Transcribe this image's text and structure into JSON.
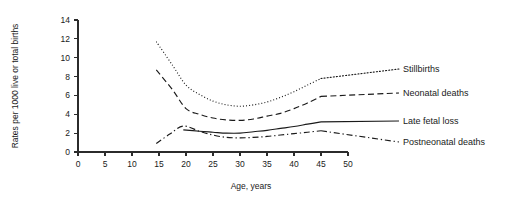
{
  "chart_data": {
    "type": "line",
    "title": "",
    "xlabel": "Age, years",
    "ylabel": "Rates per 1000 live or total births",
    "xlim": [
      0,
      50
    ],
    "ylim": [
      0,
      14
    ],
    "xticks": [
      0,
      5,
      10,
      15,
      20,
      25,
      30,
      35,
      40,
      45,
      50
    ],
    "yticks": [
      0,
      2,
      4,
      6,
      8,
      10,
      12,
      14
    ],
    "grid": false,
    "legend_position": "right-inline-labels",
    "series": [
      {
        "name": "Stillbirths",
        "style": "dotted",
        "x": [
          14.5,
          17.5,
          20,
          22.5,
          25,
          27.5,
          30,
          32.5,
          35,
          37.5,
          40,
          42.5,
          45
        ],
        "y": [
          11.7,
          9.2,
          7.1,
          6.1,
          5.4,
          5.0,
          4.85,
          5.0,
          5.3,
          5.8,
          6.4,
          7.1,
          7.8
        ]
      },
      {
        "name": "Neonatal deaths",
        "style": "dashed",
        "x": [
          14.5,
          17.5,
          20,
          22.5,
          25,
          27.5,
          30,
          32.5,
          35,
          37.5,
          40,
          42.5,
          45
        ],
        "y": [
          8.7,
          6.6,
          4.6,
          4.0,
          3.6,
          3.4,
          3.35,
          3.5,
          3.8,
          4.1,
          4.6,
          5.2,
          5.9
        ]
      },
      {
        "name": "Late fetal loss",
        "style": "solid",
        "x": [
          19.5,
          22.5,
          25,
          27.5,
          30,
          32.5,
          35,
          37.5,
          40,
          42.5,
          45
        ],
        "y": [
          2.35,
          2.2,
          2.1,
          2.0,
          2.0,
          2.15,
          2.3,
          2.5,
          2.7,
          2.95,
          3.2
        ]
      },
      {
        "name": "Postneonatal deaths",
        "style": "dashdot",
        "x": [
          14.5,
          17,
          19.5,
          22.5,
          25,
          27.5,
          30,
          32.5,
          35,
          37.5,
          40,
          42.5,
          45
        ],
        "y": [
          0.9,
          1.9,
          2.75,
          2.2,
          1.8,
          1.55,
          1.5,
          1.55,
          1.65,
          1.8,
          1.95,
          2.1,
          2.25
        ]
      }
    ],
    "series_labels": [
      {
        "text": "Stillbirths",
        "x": 403,
        "y": 72
      },
      {
        "text": "Neonatal deaths",
        "x": 403,
        "y": 96
      },
      {
        "text": "Late fetal loss",
        "x": 403,
        "y": 124
      },
      {
        "text": "Postneonatal deaths",
        "x": 403,
        "y": 145
      }
    ]
  }
}
